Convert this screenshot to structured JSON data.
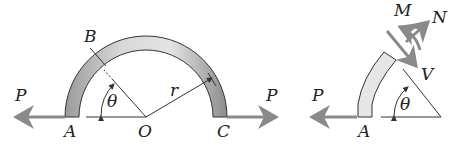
{
  "figure_left": {
    "labels": {
      "P_left": "P",
      "P_right": "P",
      "A": "A",
      "B": "B",
      "O": "O",
      "C": "C",
      "r": "r",
      "theta": "θ"
    }
  },
  "figure_right": {
    "labels": {
      "P": "P",
      "A": "A",
      "M": "M",
      "N": "N",
      "V": "V",
      "theta": "θ"
    }
  },
  "colors": {
    "arrow": "#8a8a8a",
    "line": "#333333",
    "arc_fill_light": "#e6e6e6",
    "arc_fill_dark": "#8c8c8c",
    "text": "#222222"
  }
}
